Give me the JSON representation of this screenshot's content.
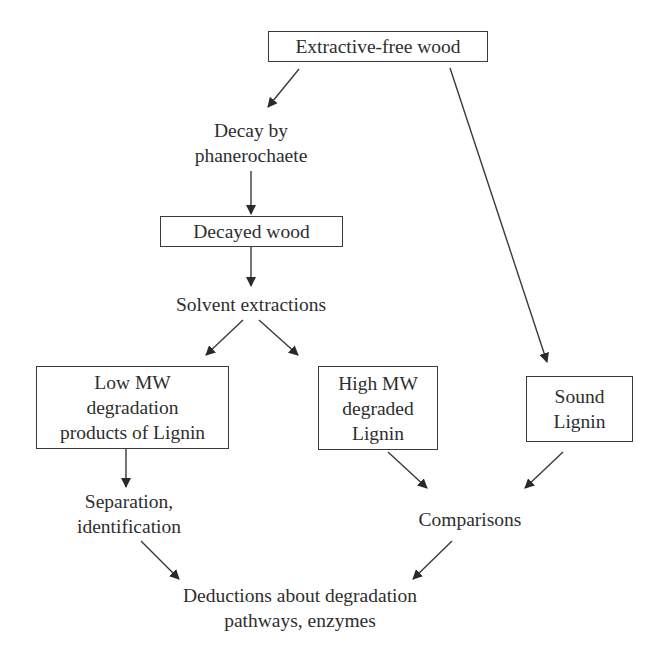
{
  "diagram": {
    "type": "flowchart",
    "nodes": {
      "extractive_free_wood": "Extractive-free wood",
      "decay_by_phanerochaete": "Decay by\nphanerochaete",
      "decayed_wood": "Decayed wood",
      "solvent_extractions": "Solvent extractions",
      "low_mw": "Low MW\ndegradation\nproducts of Lignin",
      "high_mw": "High MW\ndegraded\nLignin",
      "sound_lignin": "Sound\nLignin",
      "separation_identification": "Separation,\nidentification",
      "comparisons": "Comparisons",
      "deductions": "Deductions about degradation\npathways, enzymes"
    },
    "edges": [
      {
        "from": "extractive_free_wood",
        "to": "decay_by_phanerochaete"
      },
      {
        "from": "extractive_free_wood",
        "to": "sound_lignin"
      },
      {
        "from": "decay_by_phanerochaete",
        "to": "decayed_wood"
      },
      {
        "from": "decayed_wood",
        "to": "solvent_extractions"
      },
      {
        "from": "solvent_extractions",
        "to": "low_mw"
      },
      {
        "from": "solvent_extractions",
        "to": "high_mw"
      },
      {
        "from": "low_mw",
        "to": "separation_identification"
      },
      {
        "from": "high_mw",
        "to": "comparisons"
      },
      {
        "from": "sound_lignin",
        "to": "comparisons"
      },
      {
        "from": "separation_identification",
        "to": "deductions"
      },
      {
        "from": "comparisons",
        "to": "deductions"
      }
    ],
    "colors": {
      "line": "#3a3a3a",
      "text": "#2e2e2e",
      "background": "#ffffff"
    }
  }
}
